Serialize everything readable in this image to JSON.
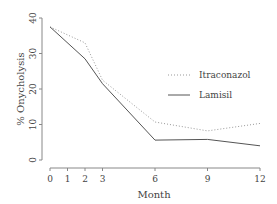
{
  "chart_data": {
    "type": "line",
    "title": "",
    "xlabel": "Month",
    "ylabel": "% Onycholysis",
    "x": [
      0,
      2,
      3,
      6,
      9,
      12
    ],
    "xticks": [
      0,
      1,
      2,
      3,
      6,
      9,
      12
    ],
    "yticks": [
      0,
      10,
      20,
      30,
      40
    ],
    "xlim": [
      0,
      12
    ],
    "ylim": [
      0,
      40
    ],
    "grid": false,
    "legend_position": "upper right (inside)",
    "series": [
      {
        "name": "Itraconazole",
        "style": "dotted",
        "values": [
          37.5,
          33,
          22.5,
          10.7,
          8.2,
          10.3
        ]
      },
      {
        "name": "Lamisil",
        "style": "solid",
        "values": [
          37.5,
          28.5,
          21.5,
          5.6,
          5.8,
          4.0
        ]
      }
    ]
  },
  "legend": {
    "items": [
      {
        "label": "Itraconazol"
      },
      {
        "label": "Lamisil"
      }
    ]
  },
  "axes": {
    "xlabel": "Month",
    "ylabel": "% Onycholysis",
    "xtick_labels": [
      "0",
      "1",
      "2",
      "3",
      "6",
      "9",
      "12"
    ],
    "ytick_labels": [
      "0",
      "10",
      "20",
      "30",
      "40"
    ]
  },
  "colors": {
    "axis": "#888888",
    "line": "#555555",
    "dotted": "#999999"
  }
}
